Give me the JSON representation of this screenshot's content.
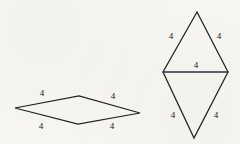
{
  "canvas": {
    "width": 240,
    "height": 144,
    "background_color": "#f7f6f2",
    "stroke_color": "#23221f",
    "diagonal_color": "#2b3340",
    "text_color": "#20201e"
  },
  "figures": [
    {
      "name": "flat-rhombus",
      "description": "flat rhombus",
      "vertices": [
        {
          "x": 15,
          "y": 108
        },
        {
          "x": 79,
          "y": 96
        },
        {
          "x": 140,
          "y": 113
        },
        {
          "x": 78,
          "y": 124
        }
      ],
      "side_labels": [
        {
          "id": "top-left",
          "text": "4",
          "x": 42,
          "y": 96
        },
        {
          "id": "top-right",
          "text": "4",
          "x": 113,
          "y": 99
        },
        {
          "id": "bottom-left",
          "text": "4",
          "x": 41,
          "y": 129
        },
        {
          "id": "bottom-right",
          "text": "4",
          "x": 112,
          "y": 129
        }
      ]
    },
    {
      "name": "tall-rhombus",
      "description": "tall rhombus split by a horizontal diagonal into two triangles",
      "vertices": [
        {
          "x": 197,
          "y": 12
        },
        {
          "x": 228,
          "y": 72
        },
        {
          "x": 194,
          "y": 138
        },
        {
          "x": 163,
          "y": 72
        }
      ],
      "diagonal": {
        "x1": 163,
        "y1": 72,
        "x2": 228,
        "y2": 72
      },
      "side_labels": [
        {
          "id": "upper-left",
          "text": "4",
          "x": 171,
          "y": 39
        },
        {
          "id": "upper-right",
          "text": "4",
          "x": 219,
          "y": 39
        },
        {
          "id": "diagonal",
          "text": "4",
          "x": 196,
          "y": 68
        },
        {
          "id": "lower-left",
          "text": "4",
          "x": 173,
          "y": 118
        },
        {
          "id": "lower-right",
          "text": "4",
          "x": 216,
          "y": 118
        }
      ]
    }
  ]
}
